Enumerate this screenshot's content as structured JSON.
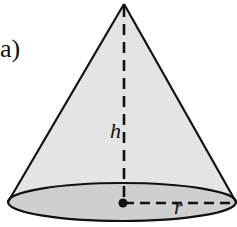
{
  "figure": {
    "part_label": "a)",
    "shape": "cone",
    "labels": {
      "height": "h",
      "radius": "r"
    },
    "colors": {
      "lateral_fill": "#e4e4e4",
      "base_fill": "#cfcfcf",
      "stroke": "#111111"
    }
  }
}
